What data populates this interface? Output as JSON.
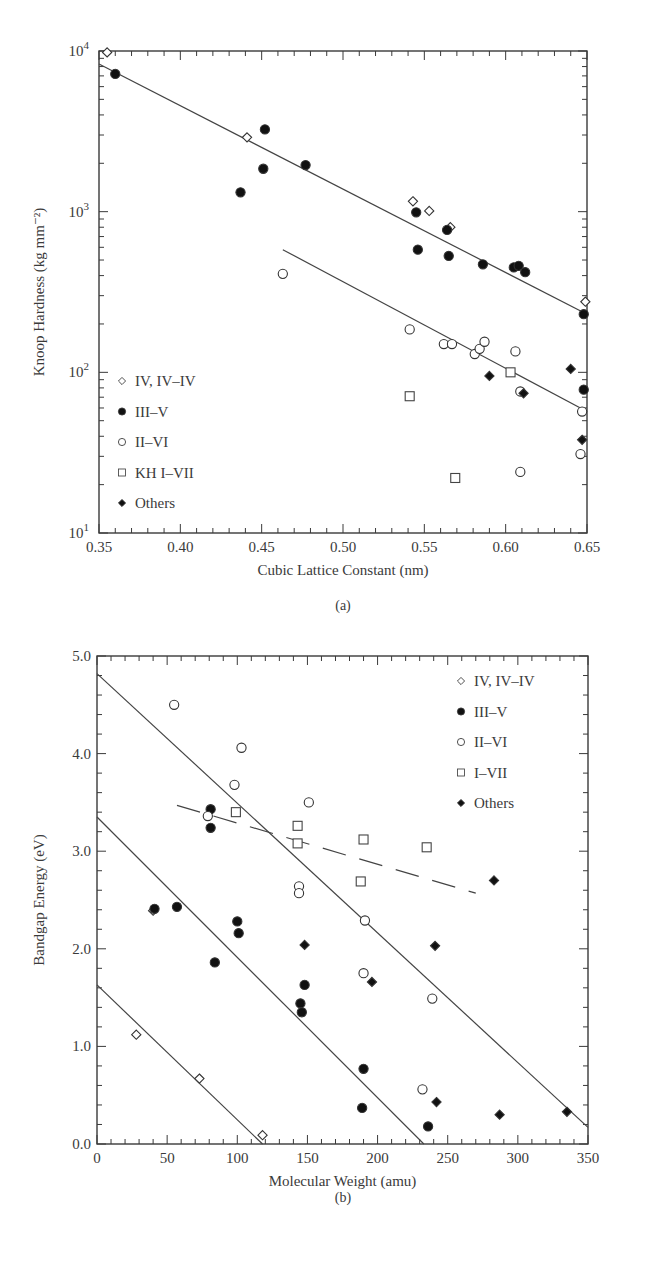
{
  "chart_data": [
    {
      "panel": "(a)",
      "type": "scatter",
      "title": "",
      "xlabel": "Cubic Lattice Constant (nm)",
      "ylabel": "Knoop Hardness (kg mm⁻²)",
      "xlim": [
        0.35,
        0.65
      ],
      "ylim": [
        10,
        10000
      ],
      "yscale": "log",
      "xticks": [
        "0.35",
        "0.40",
        "0.45",
        "0.50",
        "0.55",
        "0.60",
        "0.65"
      ],
      "yticks": [
        {
          "base": "10",
          "exp": "1"
        },
        {
          "base": "10",
          "exp": "2"
        },
        {
          "base": "10",
          "exp": "3"
        },
        {
          "base": "10",
          "exp": "4"
        }
      ],
      "legend_position": "lower left",
      "series": [
        {
          "name": "IV, IV–IV",
          "marker": "open-diamond",
          "points": [
            [
              0.355,
              9800
            ],
            [
              0.441,
              2900
            ],
            [
              0.543,
              1160
            ],
            [
              0.553,
              1010
            ],
            [
              0.566,
              800
            ],
            [
              0.649,
              275
            ]
          ]
        },
        {
          "name": "III–V",
          "marker": "filled-circle",
          "points": [
            [
              0.36,
              7200
            ],
            [
              0.437,
              1320
            ],
            [
              0.451,
              1850
            ],
            [
              0.452,
              3250
            ],
            [
              0.477,
              1950
            ],
            [
              0.545,
              990
            ],
            [
              0.546,
              580
            ],
            [
              0.564,
              770
            ],
            [
              0.565,
              530
            ],
            [
              0.586,
              470
            ],
            [
              0.605,
              450
            ],
            [
              0.608,
              460
            ],
            [
              0.612,
              420
            ],
            [
              0.648,
              230
            ],
            [
              0.648,
              78
            ]
          ]
        },
        {
          "name": "II–VI",
          "marker": "open-circle",
          "points": [
            [
              0.463,
              410
            ],
            [
              0.541,
              185
            ],
            [
              0.562,
              150
            ],
            [
              0.567,
              150
            ],
            [
              0.581,
              130
            ],
            [
              0.584,
              140
            ],
            [
              0.587,
              155
            ],
            [
              0.606,
              135
            ],
            [
              0.609,
              76
            ],
            [
              0.609,
              24
            ],
            [
              0.647,
              57
            ],
            [
              0.646,
              31
            ]
          ]
        },
        {
          "name": "KH I–VII",
          "marker": "open-square",
          "points": [
            [
              0.541,
              71
            ],
            [
              0.569,
              22
            ],
            [
              0.603,
              100
            ]
          ]
        },
        {
          "name": "Others",
          "marker": "filled-diamond",
          "points": [
            [
              0.59,
              95
            ],
            [
              0.611,
              74
            ],
            [
              0.64,
              105
            ],
            [
              0.647,
              38
            ]
          ]
        }
      ],
      "fit_lines": [
        {
          "style": "solid",
          "from": [
            0.35,
            8300
          ],
          "to": [
            0.65,
            230
          ]
        },
        {
          "style": "solid",
          "from": [
            0.463,
            580
          ],
          "to": [
            0.65,
            57
          ]
        }
      ]
    },
    {
      "panel": "(b)",
      "type": "scatter",
      "title": "",
      "xlabel": "Molecular Weight (amu)",
      "ylabel": "Bandgap Energy (eV)",
      "xlim": [
        0,
        350
      ],
      "ylim": [
        0.0,
        5.0
      ],
      "yscale": "linear",
      "xticks": [
        "0",
        "50",
        "100",
        "150",
        "200",
        "250",
        "300",
        "350"
      ],
      "yticks": [
        "0.0",
        "1.0",
        "2.0",
        "3.0",
        "4.0",
        "5.0"
      ],
      "legend_position": "upper right",
      "series": [
        {
          "name": "IV, IV–IV",
          "marker": "open-diamond",
          "points": [
            [
              28,
              1.12
            ],
            [
              40,
              2.39
            ],
            [
              73,
              0.67
            ],
            [
              118,
              0.09
            ]
          ]
        },
        {
          "name": "III–V",
          "marker": "filled-circle",
          "points": [
            [
              41,
              2.41
            ],
            [
              57,
              2.43
            ],
            [
              84,
              1.86
            ],
            [
              81,
              3.43
            ],
            [
              81,
              3.24
            ],
            [
              100,
              2.28
            ],
            [
              101,
              2.16
            ],
            [
              145,
              1.44
            ],
            [
              146,
              1.35
            ],
            [
              148,
              1.63
            ],
            [
              190,
              0.77
            ],
            [
              189,
              0.37
            ],
            [
              236,
              0.18
            ]
          ]
        },
        {
          "name": "II–VI",
          "marker": "open-circle",
          "points": [
            [
              55,
              4.5
            ],
            [
              79,
              3.36
            ],
            [
              98,
              3.68
            ],
            [
              103,
              4.06
            ],
            [
              151,
              3.5
            ],
            [
              144,
              2.64
            ],
            [
              144,
              2.57
            ],
            [
              191,
              2.29
            ],
            [
              190,
              1.75
            ],
            [
              239,
              1.49
            ],
            [
              232,
              0.56
            ]
          ]
        },
        {
          "name": "I–VII",
          "marker": "open-square",
          "points": [
            [
              99,
              3.4
            ],
            [
              143,
              3.26
            ],
            [
              143,
              3.08
            ],
            [
              190,
              3.12
            ],
            [
              188,
              2.69
            ],
            [
              235,
              3.04
            ]
          ]
        },
        {
          "name": "Others",
          "marker": "filled-diamond",
          "points": [
            [
              148,
              2.04
            ],
            [
              196,
              1.66
            ],
            [
              241,
              2.03
            ],
            [
              242,
              0.43
            ],
            [
              283,
              2.7
            ],
            [
              287,
              0.3
            ],
            [
              335,
              0.33
            ]
          ]
        }
      ],
      "fit_lines": [
        {
          "style": "solid",
          "from": [
            0,
            4.82
          ],
          "to": [
            350,
            0.17
          ]
        },
        {
          "style": "solid",
          "from": [
            0,
            3.35
          ],
          "to": [
            233,
            0.0
          ]
        },
        {
          "style": "solid",
          "from": [
            0,
            1.63
          ],
          "to": [
            118,
            0.0
          ]
        },
        {
          "style": "dashed",
          "from": [
            57,
            3.47
          ],
          "to": [
            270,
            2.57
          ]
        }
      ]
    }
  ]
}
